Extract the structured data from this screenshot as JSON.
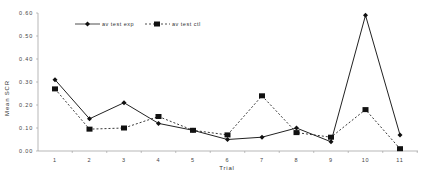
{
  "chart_data": {
    "type": "line",
    "title": "",
    "xlabel": "Trial",
    "ylabel": "Mean SCR",
    "categories": [
      "1",
      "2",
      "3",
      "4",
      "5",
      "6",
      "7",
      "8",
      "9",
      "10",
      "11"
    ],
    "ylim": [
      0.0,
      0.6
    ],
    "yticks": [
      "0.00",
      "0.10",
      "0.20",
      "0.30",
      "0.40",
      "0.50",
      "0.60"
    ],
    "grid": false,
    "legend_position": "top-inside",
    "series": [
      {
        "name": "av test exp",
        "style": "solid",
        "marker": "diamond",
        "color": "#222222",
        "values": [
          0.31,
          0.14,
          0.21,
          0.12,
          0.09,
          0.05,
          0.06,
          0.1,
          0.04,
          0.59,
          0.07
        ]
      },
      {
        "name": "av test ctl",
        "style": "dashed",
        "marker": "square",
        "color": "#222222",
        "values": [
          0.27,
          0.095,
          0.1,
          0.15,
          0.09,
          0.07,
          0.24,
          0.08,
          0.06,
          0.18,
          0.01
        ]
      }
    ]
  }
}
